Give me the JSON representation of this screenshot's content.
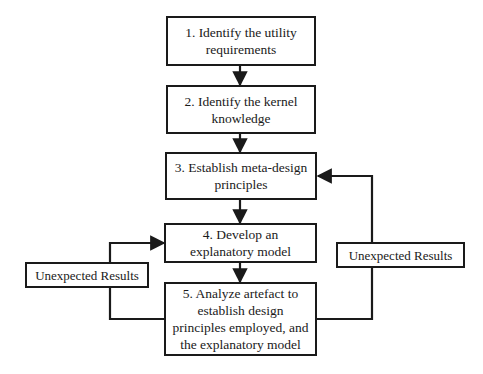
{
  "diagram": {
    "type": "flowchart",
    "steps": [
      {
        "id": "step1",
        "label": "1. Identify the utility requirements"
      },
      {
        "id": "step2",
        "label": "2. Identify the kernel knowledge"
      },
      {
        "id": "step3",
        "label": "3. Establish meta-design principles"
      },
      {
        "id": "step4",
        "label": "4. Develop an explanatory model"
      },
      {
        "id": "step5",
        "label": "5. Analyze artefact to establish design principles employed, and the explanatory model"
      }
    ],
    "feedback": {
      "left": {
        "label": "Unexpected Results",
        "from": "step5",
        "to": "step4"
      },
      "right": {
        "label": "Unexpected Results",
        "from": "step5",
        "to": "step3"
      }
    },
    "edges": [
      {
        "from": "step1",
        "to": "step2"
      },
      {
        "from": "step2",
        "to": "step3"
      },
      {
        "from": "step3",
        "to": "step4"
      },
      {
        "from": "step4",
        "to": "step5"
      },
      {
        "from": "step5",
        "to": "step4",
        "via": "Unexpected Results (left)"
      },
      {
        "from": "step5",
        "to": "step3",
        "via": "Unexpected Results (right)"
      }
    ],
    "colors": {
      "stroke": "#1a1a1a",
      "background": "#ffffff"
    }
  }
}
